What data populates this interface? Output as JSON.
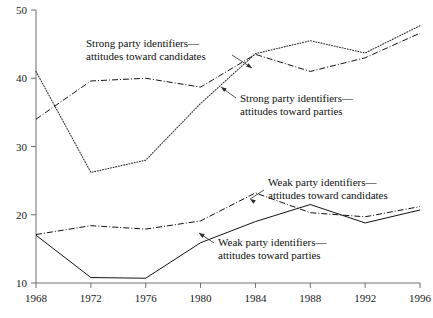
{
  "chart_data": {
    "type": "line",
    "title": "",
    "subtitle": "",
    "xlabel": "",
    "ylabel": "",
    "x": [
      1968,
      1972,
      1976,
      1980,
      1984,
      1988,
      1992,
      1996
    ],
    "categories": [
      "1968",
      "1972",
      "1976",
      "1980",
      "1984",
      "1988",
      "1992",
      "1996"
    ],
    "xlim": [
      1968,
      1996
    ],
    "ylim": [
      10,
      50
    ],
    "yticks": [
      10,
      20,
      30,
      40,
      50
    ],
    "ytick_labels": [
      "10",
      "20",
      "30",
      "40",
      "50"
    ],
    "xticks": [
      1968,
      1972,
      1976,
      1980,
      1984,
      1988,
      1992,
      1996
    ],
    "grid": false,
    "legend": "annotations-inline",
    "series": [
      {
        "name": "Strong party identifiers—attitudes toward candidates",
        "style": "dotted",
        "values": [
          41.0,
          26.2,
          28.0,
          36.3,
          43.6,
          45.5,
          43.7,
          47.7
        ]
      },
      {
        "name": "Strong party identifiers—attitudes toward parties",
        "style": "dash-dot",
        "values": [
          34.0,
          39.6,
          40.0,
          38.7,
          43.5,
          41.0,
          43.0,
          46.6
        ]
      },
      {
        "name": "Weak party identifiers—attitudes toward candidates",
        "style": "dash-dot",
        "values": [
          17.1,
          18.4,
          17.9,
          19.1,
          23.2,
          20.3,
          19.7,
          21.2
        ]
      },
      {
        "name": "Weak party identifiers—attitudes toward parties",
        "style": "solid",
        "values": [
          17.0,
          10.8,
          10.7,
          15.9,
          19.0,
          21.5,
          18.8,
          20.7
        ]
      }
    ],
    "annotations": [
      {
        "id": "strong-candidates",
        "line1": "Strong party identifiers—",
        "line2": "attitudes toward candidates",
        "text_x": 86,
        "text_y": 47,
        "leader": [
          [
            232,
            55
          ],
          [
            252,
            68
          ]
        ],
        "arrow_at": [
          252,
          68
        ],
        "arrow_angle": 33
      },
      {
        "id": "strong-parties",
        "line1": "Strong party identifiers—",
        "line2": "attitudes toward parties",
        "text_x": 240,
        "text_y": 102,
        "leader": [
          [
            236,
            98
          ],
          [
            221,
            87
          ]
        ],
        "arrow_at": [
          221,
          87
        ],
        "arrow_angle": 216
      },
      {
        "id": "weak-candidates",
        "line1": "Weak party identifiers—",
        "line2": "attitudes toward candidates",
        "text_x": 268,
        "text_y": 186,
        "leader": [
          [
            264,
            190
          ],
          [
            250,
            199
          ]
        ],
        "arrow_at": [
          250,
          199
        ],
        "arrow_angle": 213
      },
      {
        "id": "weak-parties",
        "line1": "Weak party identifiers—",
        "line2": "attitudes toward parties",
        "text_x": 218,
        "text_y": 246,
        "leader": [
          [
            214,
            243
          ],
          [
            199,
            233
          ]
        ],
        "arrow_at": [
          199,
          233
        ],
        "arrow_angle": 214
      }
    ],
    "colors": {
      "axis": "#6f6f6f",
      "ink": "#121212",
      "background": "#ffffff"
    }
  }
}
